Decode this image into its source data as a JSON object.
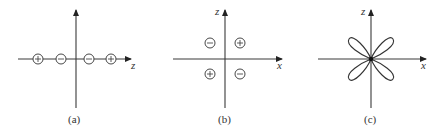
{
  "panels": [
    {
      "id": "a",
      "caption": "(a)",
      "axis_labels": {
        "horizontal": "z",
        "vertical": ""
      },
      "lobes": [
        {
          "sign": "+",
          "position": "far-left"
        },
        {
          "sign": "−",
          "position": "near-left"
        },
        {
          "sign": "−",
          "position": "near-right"
        },
        {
          "sign": "+",
          "position": "far-right"
        }
      ]
    },
    {
      "id": "b",
      "caption": "(b)",
      "axis_labels": {
        "horizontal": "x",
        "vertical": "z"
      },
      "lobes": [
        {
          "sign": "−",
          "quadrant": "upper-left"
        },
        {
          "sign": "+",
          "quadrant": "upper-right"
        },
        {
          "sign": "+",
          "quadrant": "lower-left"
        },
        {
          "sign": "−",
          "quadrant": "lower-right"
        }
      ]
    },
    {
      "id": "c",
      "caption": "(c)",
      "axis_labels": {
        "horizontal": "x",
        "vertical": "z"
      },
      "shape": "four-leaf clover (d-orbital angular plot)"
    }
  ]
}
